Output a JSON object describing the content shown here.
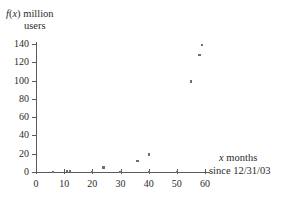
{
  "chart_data": {
    "type": "scatter",
    "title": "",
    "ylabel_line1": "f(x) million",
    "ylabel_line2": "users",
    "ylabel_italic_f": "f",
    "ylabel_italic_x": "x",
    "xlabel_line1": "x months",
    "xlabel_line2": "since 12/31/03",
    "xlabel_italic_x": "x",
    "xlim": [
      0,
      60
    ],
    "ylim": [
      0,
      140
    ],
    "xticks": [
      0,
      10,
      20,
      30,
      40,
      50,
      60
    ],
    "yticks": [
      0,
      20,
      40,
      60,
      80,
      100,
      120,
      140
    ],
    "xtick_labels": [
      "0",
      "10",
      "20",
      "30",
      "40",
      "50",
      "60"
    ],
    "ytick_labels": [
      "0",
      "20",
      "40",
      "60",
      "80",
      "100",
      "120",
      "140"
    ],
    "grid": false,
    "legend": null,
    "marker_color": "#6e6e6e",
    "axis_color": "#5a5a5a",
    "points": [
      {
        "x": 6,
        "y": 0
      },
      {
        "x": 11,
        "y": 1
      },
      {
        "x": 12,
        "y": 1
      },
      {
        "x": 20,
        "y": 0
      },
      {
        "x": 24,
        "y": 5
      },
      {
        "x": 30,
        "y": 0
      },
      {
        "x": 36,
        "y": 12
      },
      {
        "x": 40,
        "y": 19
      },
      {
        "x": 40,
        "y": 0
      },
      {
        "x": 50,
        "y": 0
      },
      {
        "x": 55,
        "y": 99
      },
      {
        "x": 58,
        "y": 128
      },
      {
        "x": 59,
        "y": 139
      }
    ]
  }
}
